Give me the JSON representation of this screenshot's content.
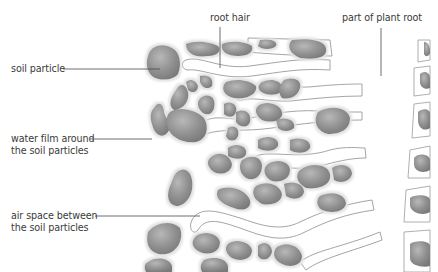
{
  "diagram": {
    "type": "labelled cross-section",
    "colors": {
      "background": "#ffffff",
      "particle_fill": "#8c8c8c",
      "particle_highlight": "#b4b4b4",
      "water_film": "#e6e6e6",
      "root_outline": "#9a9a9a",
      "leader_line": "#4a4a4a",
      "label_text": "#3a3a3a"
    },
    "labels": {
      "soil_particle": "soil particle",
      "water_film_line1": "water film around",
      "water_film_line2": "the soil particles",
      "air_space_line1": "air space between",
      "air_space_line2": "the soil particles",
      "root_hair": "root hair",
      "plant_root": "part of plant root"
    }
  }
}
